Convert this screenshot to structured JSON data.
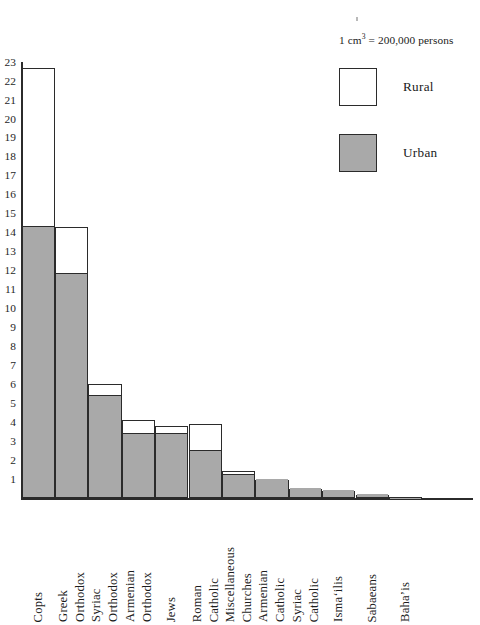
{
  "legend": {
    "caption_pre": "1 cm",
    "caption_sup": "3",
    "caption_post": " = 200,000 persons",
    "caption_full": "1 cm³ = 200,000 persons",
    "entries": [
      {
        "label": "Rural",
        "swatch": "white-square-icon",
        "color": "#ffffff"
      },
      {
        "label": "Urban",
        "swatch": "gray-square-icon",
        "color": "#a9a9a9"
      }
    ]
  },
  "axis": {
    "y_tick_labels": [
      "23",
      "22",
      "21",
      "20",
      "19",
      "18",
      "17",
      "16",
      "15",
      "14",
      "13",
      "12",
      "11",
      "10",
      "9",
      "8",
      "7",
      "6",
      "5",
      "4",
      "3",
      "2",
      "1"
    ],
    "y_tick_values": [
      23,
      22,
      21,
      20,
      19,
      18,
      17,
      16,
      15,
      14,
      13,
      12,
      11,
      10,
      9,
      8,
      7,
      6,
      5,
      4,
      3,
      2,
      1
    ],
    "y_unit_note": "each unit = 1 cm³ = 200,000 persons",
    "baseline_value": 0
  },
  "chart_data": {
    "type": "bar",
    "stacked": true,
    "title": "",
    "subtitle": "",
    "xlabel": "",
    "ylabel": "",
    "ylim": [
      0,
      23
    ],
    "grid": false,
    "legend_position": "top-right",
    "annotations": [
      "1 cm³ = 200,000 persons"
    ],
    "categories": [
      "Copts",
      "Greek Orthodox",
      "Syriac Orthodox",
      "Armenian Orthodox",
      "Jews",
      "Roman Catholic",
      "Miscellaneous Churches",
      "Armenian Catholic",
      "Syriac Catholic",
      "Isma'ilis",
      "Sabaeans",
      "Baha'is"
    ],
    "category_lines": [
      [
        "Copts"
      ],
      [
        "Greek",
        "Orthodox"
      ],
      [
        "Syriac",
        "Orthodox"
      ],
      [
        "Armenian",
        "Orthodox"
      ],
      [
        "Jews"
      ],
      [
        "Roman",
        "Catholic"
      ],
      [
        "Miscellaneous",
        "Churches"
      ],
      [
        "Armenian",
        "Catholic"
      ],
      [
        "Syriac",
        "Catholic"
      ],
      [
        "Isma‘ilis"
      ],
      [
        "Sabaeans"
      ],
      [
        "Baha’is"
      ]
    ],
    "series": [
      {
        "name": "Urban",
        "color": "#a9a9a9",
        "values": [
          14.3,
          11.8,
          5.4,
          3.4,
          3.4,
          2.5,
          1.2,
          0.95,
          0.5,
          0.35,
          0.15,
          0.03
        ]
      },
      {
        "name": "Rural",
        "color": "#ffffff",
        "values": [
          8.4,
          2.5,
          0.6,
          0.7,
          0.4,
          1.4,
          0.2,
          0.0,
          0.0,
          0.0,
          0.0,
          0.0
        ]
      }
    ],
    "totals": [
      22.7,
      14.3,
      6.0,
      4.1,
      3.8,
      3.9,
      1.4,
      0.95,
      0.5,
      0.35,
      0.15,
      0.03
    ]
  }
}
